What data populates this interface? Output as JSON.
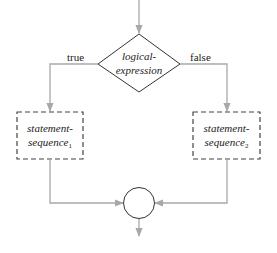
{
  "diagram": {
    "type": "flowchart",
    "colors": {
      "line": "#a8a8a8",
      "shape_stroke": "#333333",
      "dashed_stroke": "#444444",
      "text": "#222222",
      "background": "#ffffff"
    },
    "decision": {
      "line1": "logical-",
      "line2": "expression"
    },
    "branches": {
      "true_label": "true",
      "false_label": "false"
    },
    "true_block": {
      "line1": "statement-",
      "line2": "sequence",
      "subscript": "1"
    },
    "false_block": {
      "line1": "statement-",
      "line2": "sequence",
      "subscript": "2"
    },
    "join_node": {
      "shape": "circle"
    }
  }
}
